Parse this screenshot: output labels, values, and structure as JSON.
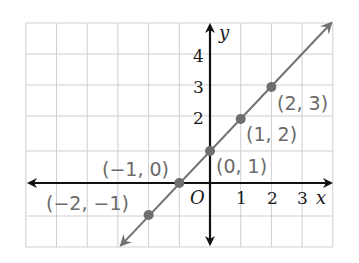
{
  "chart_data": {
    "type": "line",
    "title": "",
    "xlabel": "x",
    "ylabel": "y",
    "origin_label": "O",
    "xlim": [
      -6,
      4
    ],
    "ylim": [
      -2,
      5
    ],
    "grid": true,
    "x_tick_labels": [
      "1",
      "2",
      "3"
    ],
    "y_tick_labels": [
      "2",
      "3",
      "4"
    ],
    "x_ticks": [
      1,
      2,
      3
    ],
    "y_ticks": [
      2,
      3,
      4
    ],
    "series": [
      {
        "name": "y = x + 1",
        "line": {
          "from": [
            -2.9,
            -1.95
          ],
          "to": [
            3.95,
            5.0
          ],
          "arrows": "both"
        },
        "points": [
          {
            "x": -2,
            "y": -1,
            "label": "(−2, −1)"
          },
          {
            "x": -1,
            "y": 0,
            "label": "(−1, 0)"
          },
          {
            "x": 0,
            "y": 1,
            "label": "(0, 1)"
          },
          {
            "x": 1,
            "y": 2,
            "label": "(1, 2)"
          },
          {
            "x": 2,
            "y": 3,
            "label": "(2, 3)"
          }
        ]
      }
    ],
    "colors": {
      "grid": "#cfcfcf",
      "axes": "#111111",
      "line": "#727272",
      "points": "#6e6e6e",
      "point_labels": "#6a6a6a"
    }
  }
}
